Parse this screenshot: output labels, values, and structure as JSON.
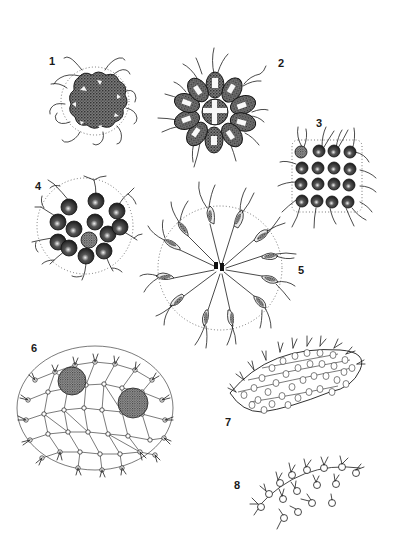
{
  "plate": {
    "title": "Colonial green algae plate",
    "background": "#ffffff",
    "ink_color": "#1c1c1c"
  },
  "figures": [
    {
      "number": "1",
      "label_pos": [
        49,
        56
      ],
      "description": "Spherical colony of 8 dark cells with paired flagella, dotted envelope"
    },
    {
      "number": "2",
      "label_pos": [
        278,
        58
      ],
      "description": "Rosette colony of 16 wedge-shaped stippled cells with flagella"
    },
    {
      "number": "3",
      "label_pos": [
        316,
        118
      ],
      "description": "Flat square plate colony of 16 dark round cells with flagella"
    },
    {
      "number": "4",
      "label_pos": [
        35,
        181
      ],
      "description": "Spherical colony of 16 dark round cells with paired flagella, dotted envelope"
    },
    {
      "number": "5",
      "label_pos": [
        298,
        265
      ],
      "description": "Radiating colony of pear-shaped cells joined at center, long flagella"
    },
    {
      "number": "6",
      "label_pos": [
        31,
        343
      ],
      "description": "Large hollow sphere of many cells linked by cytoplasmic strands, two dark daughter colonies"
    },
    {
      "number": "7",
      "label_pos": [
        225,
        417
      ],
      "description": "Section of colony wall showing polygonal cells with nuclei"
    },
    {
      "number": "8",
      "label_pos": [
        234,
        480
      ],
      "description": "Detail of peripheral cells with flagella along colony surface"
    }
  ]
}
